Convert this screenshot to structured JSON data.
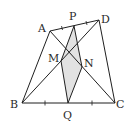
{
  "diagram": {
    "type": "geometry",
    "points": {
      "A": {
        "label": "A",
        "x": 50,
        "y": 31,
        "lx": 38,
        "ly": 32
      },
      "P": {
        "label": "P",
        "x": 74,
        "y": 26,
        "lx": 69,
        "ly": 20
      },
      "D": {
        "label": "D",
        "x": 99,
        "y": 20,
        "lx": 101,
        "ly": 23
      },
      "B": {
        "label": "B",
        "x": 22,
        "y": 103,
        "lx": 10,
        "ly": 108
      },
      "Q": {
        "label": "Q",
        "x": 68,
        "y": 103,
        "lx": 63,
        "ly": 119
      },
      "C": {
        "label": "C",
        "x": 115,
        "y": 103,
        "lx": 116,
        "ly": 108
      },
      "M": {
        "label": "M",
        "x": 61,
        "y": 61,
        "lx": 48,
        "ly": 62
      },
      "N": {
        "label": "N",
        "x": 82,
        "y": 67,
        "lx": 84,
        "ly": 67
      }
    },
    "segments": [
      "AB",
      "BC",
      "CD",
      "DA",
      "AC",
      "BD",
      "PQ",
      "PM",
      "PN",
      "QM",
      "QN"
    ],
    "shaded_region": {
      "vertices": [
        "P",
        "M",
        "Q",
        "N"
      ],
      "fill": "#e2e2e2"
    },
    "equal_marks": [
      "AP",
      "PD",
      "BQ",
      "QC"
    ],
    "colors": {
      "stroke": "#1f1f1f",
      "label": "#2a2a2a",
      "shade": "#e2e2e2",
      "background": "#ffffff"
    }
  }
}
